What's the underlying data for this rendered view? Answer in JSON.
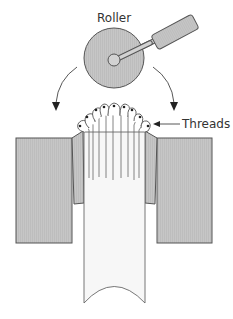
{
  "diagram": {
    "labels": {
      "roller": "Roller",
      "threads": "Threads"
    },
    "colors": {
      "fill_gray": "#c4c4c4",
      "stroke": "#555555",
      "shank_fill": "#f7f7f7",
      "background": "#ffffff"
    },
    "components": [
      "roller",
      "roller-handle",
      "left-die-block",
      "right-die-block",
      "left-tapered-die",
      "right-tapered-die",
      "shank",
      "threads-fan",
      "left-arrow",
      "right-arrow"
    ],
    "thread_count": 9
  }
}
